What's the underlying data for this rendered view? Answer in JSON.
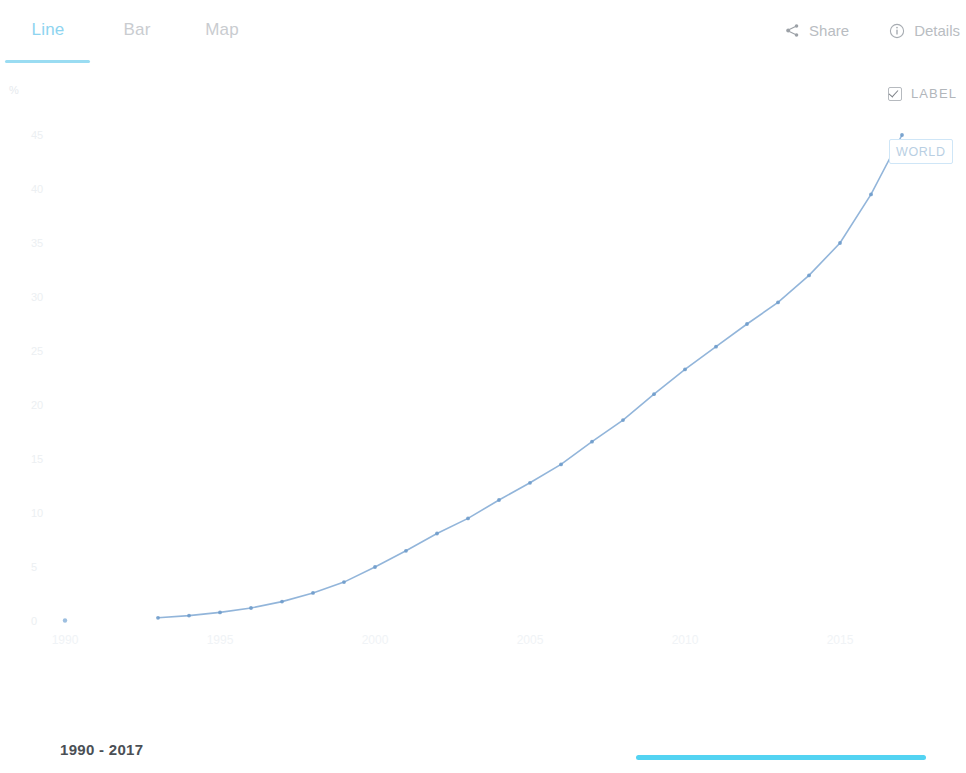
{
  "tabs": [
    {
      "id": "line",
      "label": "Line",
      "active": true
    },
    {
      "id": "bar",
      "label": "Bar",
      "active": false
    },
    {
      "id": "map",
      "label": "Map",
      "active": false
    }
  ],
  "toolbar": {
    "share_label": "Share",
    "share_icon": "share-icon",
    "details_label": "Details",
    "details_icon": "info-circle-icon"
  },
  "label_toggle": {
    "text": "LABEL",
    "checked": true,
    "icon": "checkbox-checked-icon"
  },
  "series_label": {
    "text": "WORLD"
  },
  "footer": {
    "range_text": "1990 - 2017",
    "slider_color": "#53d3f2"
  },
  "colors": {
    "accent": "#9adcf2",
    "active_tab": "#8ed4f0",
    "inactive_tab": "#c9ccd0",
    "line": "#7fa8d4",
    "point": "#6f9ccb",
    "slider": "#53d3f2",
    "label_border": "#cfe6f7"
  },
  "chart_data": {
    "type": "line",
    "title": "",
    "xlabel": "",
    "ylabel": "%",
    "yunit": "%",
    "xlim": [
      1990,
      2017
    ],
    "ylim": [
      0,
      47
    ],
    "grid": false,
    "legend": "inline-end-label",
    "xticks": [
      1990,
      1995,
      2000,
      2005,
      2010,
      2015
    ],
    "yticks": [
      0,
      5,
      10,
      15,
      20,
      25,
      30,
      35,
      40,
      45
    ],
    "series": [
      {
        "name": "WORLD",
        "color": "#7fa8d4",
        "x": [
          1990,
          1993,
          1994,
          1995,
          1996,
          1997,
          1998,
          1999,
          2000,
          2001,
          2002,
          2003,
          2004,
          2005,
          2006,
          2007,
          2008,
          2009,
          2010,
          2011,
          2012,
          2013,
          2014,
          2015,
          2016,
          2017
        ],
        "values": [
          0.05,
          0.3,
          0.5,
          0.8,
          1.2,
          1.8,
          2.6,
          3.6,
          5.0,
          6.5,
          8.1,
          9.5,
          11.2,
          12.8,
          14.5,
          16.6,
          18.6,
          21.0,
          23.3,
          25.4,
          27.5,
          29.5,
          32.0,
          35.0,
          39.5,
          45.0
        ],
        "annotation": "WORLD"
      }
    ]
  }
}
